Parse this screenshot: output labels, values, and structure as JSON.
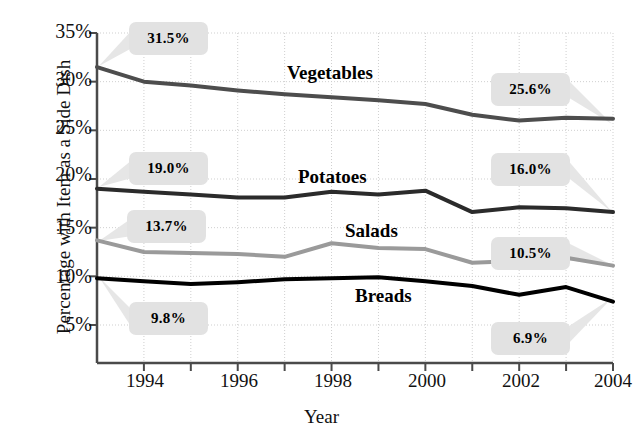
{
  "chart_data": {
    "type": "line",
    "title": "",
    "xlabel": "Year",
    "ylabel": "Percentage with Item as a Side Dish",
    "x": [
      1993,
      1994,
      1995,
      1996,
      1997,
      1998,
      1999,
      2000,
      2001,
      2002,
      2003,
      2004
    ],
    "xlim": [
      1993,
      2004
    ],
    "ylim": [
      2.5,
      35
    ],
    "yticks": [
      5,
      10,
      15,
      20,
      25,
      30,
      35
    ],
    "ytick_labels": [
      "5%",
      "10%",
      "15%",
      "20%",
      "25%",
      "30%",
      "35%"
    ],
    "xticks": [
      1994,
      1996,
      1998,
      2000,
      2002,
      2004
    ],
    "xtick_labels": [
      "1994",
      "1996",
      "1998",
      "2000",
      "2002",
      "2004"
    ],
    "grid": true,
    "legend": "inline-series-labels",
    "series": [
      {
        "name": "Vegetables",
        "color": "#4d4d4d",
        "width": 4,
        "values": [
          31.5,
          30.0,
          29.6,
          29.1,
          28.7,
          28.4,
          28.1,
          27.7,
          26.6,
          26.0,
          26.3,
          26.2
        ],
        "start_label": "31.5%",
        "end_label": "25.6%"
      },
      {
        "name": "Potatoes",
        "color": "#2b2b2b",
        "width": 4,
        "values": [
          19.0,
          18.7,
          18.4,
          18.1,
          18.1,
          18.7,
          18.4,
          18.8,
          16.6,
          17.1,
          17.0,
          16.6
        ],
        "start_label": "19.0%",
        "end_label": "16.0%"
      },
      {
        "name": "Salads",
        "color": "#9a9a9a",
        "width": 4,
        "values": [
          13.7,
          12.5,
          12.4,
          12.3,
          12.0,
          13.4,
          12.9,
          12.8,
          11.4,
          11.6,
          11.9,
          11.1
        ],
        "start_label": "13.7%",
        "end_label": "10.5%"
      },
      {
        "name": "Breads",
        "color": "#000000",
        "width": 4,
        "values": [
          9.8,
          9.5,
          9.2,
          9.4,
          9.7,
          9.8,
          9.9,
          9.5,
          9.0,
          8.1,
          8.9,
          7.4
        ],
        "start_label": "9.8%",
        "end_label": "6.9%"
      }
    ]
  },
  "axis": {
    "ylabel": "Percentage with Item as a Side Dish",
    "xlabel": "Year",
    "ytick_0": "5%",
    "ytick_1": "10%",
    "ytick_2": "15%",
    "ytick_3": "20%",
    "ytick_4": "25%",
    "ytick_5": "30%",
    "ytick_6": "35%",
    "xtick_0": "1994",
    "xtick_1": "1996",
    "xtick_2": "1998",
    "xtick_3": "2000",
    "xtick_4": "2002",
    "xtick_5": "2004"
  },
  "series_labels": {
    "vegetables": "Vegetables",
    "potatoes": "Potatoes",
    "salads": "Salads",
    "breads": "Breads"
  },
  "callouts": {
    "vegetables_start": "31.5%",
    "vegetables_end": "25.6%",
    "potatoes_start": "19.0%",
    "potatoes_end": "16.0%",
    "salads_start": "13.7%",
    "salads_end": "10.5%",
    "breads_start": "9.8%",
    "breads_end": "6.9%"
  }
}
